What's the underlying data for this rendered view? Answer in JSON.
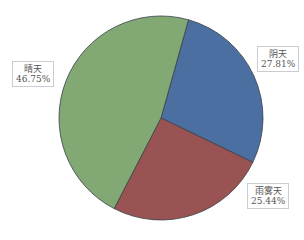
{
  "chart_data": {
    "type": "pie",
    "title": "",
    "slices": [
      {
        "label": "阴天",
        "value": 27.81,
        "display": "27.81%",
        "color": "#4a6fa0"
      },
      {
        "label": "雨雾天",
        "value": 25.44,
        "display": "25.44%",
        "color": "#9a5353"
      },
      {
        "label": "晴天",
        "value": 46.75,
        "display": "46.75%",
        "color": "#82a873"
      }
    ],
    "legend": "none",
    "data_labels": "boxed category and percent"
  }
}
